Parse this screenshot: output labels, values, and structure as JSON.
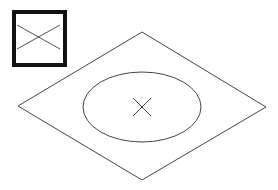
{
  "diagram": {
    "colors": {
      "background": "#ffffff",
      "stroke": "#444444",
      "icon_border": "#111111"
    },
    "inset_icon": {
      "name": "square-with-cross",
      "x": 12,
      "y": 10,
      "width": 55,
      "height": 57,
      "border_width": 4
    },
    "plane": {
      "shape": "rhombus",
      "vertices": [
        [
          142,
          32
        ],
        [
          266,
          107
        ],
        [
          142,
          180
        ],
        [
          18,
          106
        ]
      ]
    },
    "ellipse": {
      "cx": 142,
      "cy": 107,
      "rx": 59,
      "ry": 35
    },
    "center_mark": {
      "cx": 142,
      "cy": 107,
      "half_size": 9
    }
  }
}
